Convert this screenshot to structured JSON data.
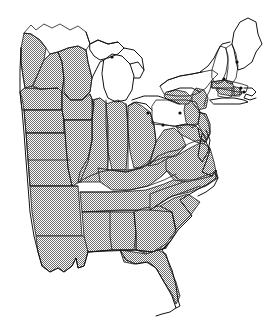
{
  "figure": {
    "title": "Eastern United States distribution map",
    "width": 280,
    "height": 325,
    "background_color": "#ffffff",
    "outline_color": "#1a1a1a",
    "shade_color": "#808080",
    "dot_color": "#0c0c0c"
  },
  "legend": {
    "shaded_meaning": "shaded (stippled) state",
    "unshaded_meaning": "unshaded state",
    "dot_meaning": "point locality marker"
  },
  "chart_data": {
    "type": "map",
    "title": "Eastern United States distribution map",
    "projection": "plain outline",
    "fill_pattern": "50% checkerboard dither",
    "shaded_states": [
      "North Dakota",
      "South Dakota",
      "Nebraska",
      "Kansas",
      "Minnesota (northwest corner)",
      "Iowa",
      "Missouri",
      "Arkansas",
      "Louisiana",
      "Wisconsin",
      "Illinois",
      "Indiana",
      "Ohio",
      "Kentucky",
      "Tennessee",
      "Mississippi",
      "Alabama",
      "Georgia",
      "Florida",
      "South Carolina",
      "North Carolina",
      "Virginia",
      "West Virginia",
      "Maryland",
      "Delaware",
      "New Jersey",
      "eastern Pennsylvania",
      "southeastern New York",
      "Connecticut",
      "Rhode Island",
      "southeastern Massachusetts"
    ],
    "unshaded_states": [
      "Minnesota (main body)",
      "Michigan",
      "central and western Pennsylvania",
      "central and western New York",
      "Vermont",
      "New Hampshire",
      "Maine",
      "western Massachusetts"
    ],
    "markers": [
      {
        "label": "marker-upper-peninsula",
        "x": 112,
        "y": 57
      },
      {
        "label": "marker-western-new-york",
        "x": 148,
        "y": 113
      },
      {
        "label": "marker-northern-ohio",
        "x": 163,
        "y": 125
      },
      {
        "label": "marker-central-pennsylvania",
        "x": 180,
        "y": 113
      },
      {
        "label": "marker-maine",
        "x": 237,
        "y": 62
      },
      {
        "label": "marker-new-hampshire",
        "x": 224,
        "y": 79
      },
      {
        "label": "marker-massachusetts-coast",
        "x": 241,
        "y": 88
      },
      {
        "label": "marker-rhode-island",
        "x": 244,
        "y": 92
      }
    ],
    "marker_count": 8,
    "grid": false,
    "legend_position": "none",
    "axis_labels_shown": false
  }
}
